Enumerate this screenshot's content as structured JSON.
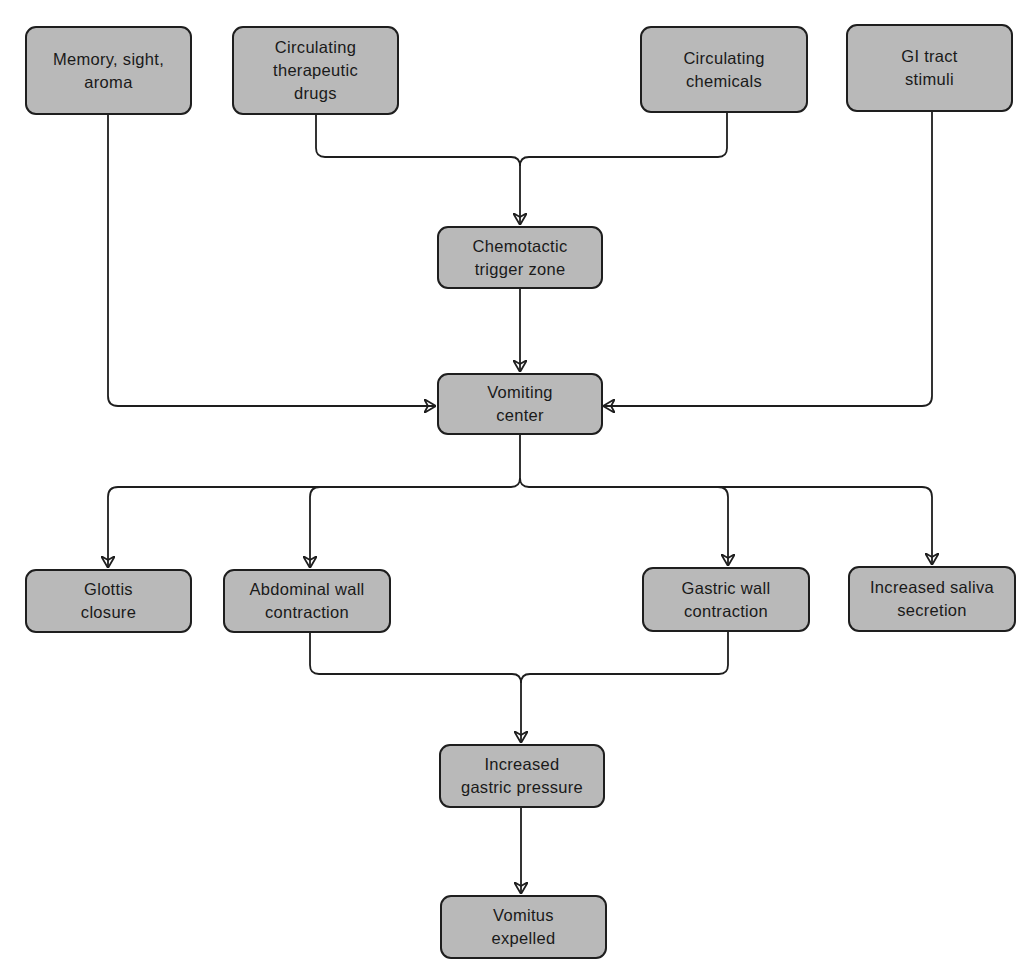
{
  "diagram": {
    "type": "flowchart",
    "colors": {
      "node_fill": "#b9b9b9",
      "node_border": "#1e1e1e",
      "line": "#1e1e1e",
      "background": "#ffffff"
    },
    "nodes": {
      "memory": {
        "label": "Memory, sight,\naroma"
      },
      "therapeutic_drugs": {
        "label": "Circulating\ntherapeutic\ndrugs"
      },
      "chemicals": {
        "label": "Circulating\nchemicals"
      },
      "gi_tract": {
        "label": "GI tract\nstimuli"
      },
      "ctz": {
        "label": "Chemotactic\ntrigger zone"
      },
      "vomiting_center": {
        "label": "Vomiting\ncenter"
      },
      "glottis": {
        "label": "Glottis\nclosure"
      },
      "abdominal": {
        "label": "Abdominal wall\ncontraction"
      },
      "gastric_wall": {
        "label": "Gastric wall\ncontraction"
      },
      "saliva": {
        "label": "Increased saliva\nsecretion"
      },
      "gastric_pressure": {
        "label": "Increased\ngastric pressure"
      },
      "vomitus": {
        "label": "Vomitus\nexpelled"
      }
    },
    "edges": [
      {
        "from": [
          "therapeutic_drugs",
          "chemicals"
        ],
        "to": "ctz"
      },
      {
        "from": "memory",
        "to": "vomiting_center"
      },
      {
        "from": "ctz",
        "to": "vomiting_center"
      },
      {
        "from": "gi_tract",
        "to": "vomiting_center"
      },
      {
        "from": "vomiting_center",
        "to": [
          "glottis",
          "abdominal",
          "gastric_wall",
          "saliva"
        ]
      },
      {
        "from": [
          "abdominal",
          "gastric_wall"
        ],
        "to": "gastric_pressure"
      },
      {
        "from": "gastric_pressure",
        "to": "vomitus"
      }
    ]
  }
}
